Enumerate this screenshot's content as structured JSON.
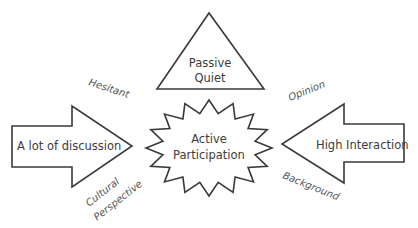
{
  "diagram": {
    "center": {
      "shape": "starburst",
      "lines": [
        "Active",
        "Participation"
      ]
    },
    "top": {
      "shape": "triangle",
      "lines": [
        "Passive",
        "Quiet"
      ]
    },
    "left": {
      "shape": "arrow-right",
      "label": "A lot of discussion"
    },
    "right": {
      "shape": "arrow-left",
      "label": "High Interaction"
    },
    "annotations": {
      "top_left": "Hesitant",
      "top_right": "Opinion",
      "bottom_left": [
        "Cultural",
        "Perspective"
      ],
      "bottom_right": "Background"
    }
  },
  "colors": {
    "stroke": "#3a3a3a",
    "text": "#3c3c3c",
    "background": "#ffffff"
  }
}
